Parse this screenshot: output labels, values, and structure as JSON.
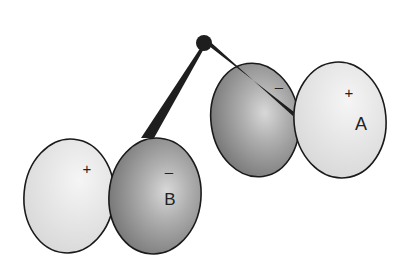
{
  "diagram": {
    "title": "",
    "central_atom": {
      "cx": 204,
      "cy": 43,
      "r": 8,
      "color": "#1e1e1e"
    },
    "orbitals": [
      {
        "id": "A",
        "label": "A",
        "negative_lobe": {
          "sign": "–",
          "cx": 255,
          "cy": 120,
          "rx": 44,
          "ry": 57,
          "rot": -8
        },
        "positive_lobe": {
          "sign": "+",
          "cx": 340,
          "cy": 120,
          "rx": 46,
          "ry": 58,
          "rot": -5
        }
      },
      {
        "id": "B",
        "label": "B",
        "negative_lobe": {
          "sign": "–",
          "cx": 155,
          "cy": 196,
          "rx": 46,
          "ry": 58,
          "rot": 5
        },
        "positive_lobe": {
          "sign": "+",
          "cx": 69,
          "cy": 196,
          "rx": 45,
          "ry": 57,
          "rot": 5
        }
      }
    ],
    "colors": {
      "positive_fill": "#e6e6e6",
      "negative_fill": "#8c8c8c",
      "outline": "#1a1a1a",
      "bond": "#1e1e1e"
    }
  }
}
